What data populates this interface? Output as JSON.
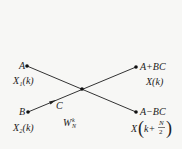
{
  "diagram": {
    "type": "butterfly",
    "nodes": {
      "in_top": {
        "label": "A",
        "sub": "X₁(k)"
      },
      "in_bottom": {
        "label": "B",
        "sub": "X₂(k)"
      },
      "out_top": {
        "label": "A+BC",
        "sub": "X(k)"
      },
      "out_bottom": {
        "label": "A−BC",
        "sub_x": "X",
        "sub_k": "k+",
        "sub_num": "N",
        "sub_den": "2"
      }
    },
    "multiplier": {
      "label": "C",
      "twiddle_base": "W",
      "twiddle_sub": "N",
      "twiddle_sup": "k"
    },
    "colors": {
      "line": "#333333",
      "text": "#222222",
      "background": "#f7f7f5"
    }
  }
}
